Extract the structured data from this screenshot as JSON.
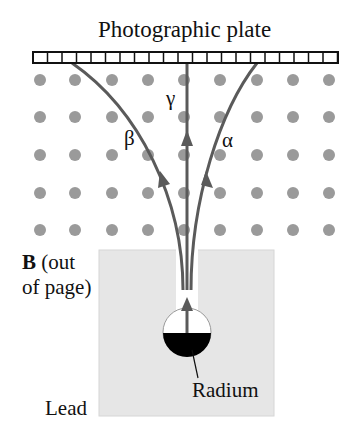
{
  "title": "Photographic plate",
  "labels": {
    "gamma": "γ",
    "beta": "β",
    "alpha": "α",
    "field_bold": "B",
    "field_rest_line1": " (out",
    "field_line2": "of page)",
    "source": "Radium",
    "material": "Lead"
  },
  "colors": {
    "dot": "#9a9a9a",
    "trajectory": "#5a5a5a",
    "lead": "#e6e6e6",
    "radium": "#000000"
  },
  "dots": {
    "columns_x": [
      40,
      75,
      112,
      148,
      184,
      220,
      257,
      293,
      329
    ],
    "rows_y": [
      80,
      117,
      155,
      193,
      230
    ]
  }
}
